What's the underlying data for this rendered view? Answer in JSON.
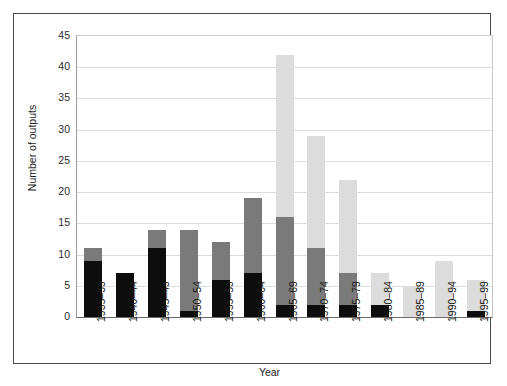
{
  "chart_data": {
    "type": "bar",
    "subtype": "stacked",
    "title": "",
    "xlabel": "Year",
    "ylabel": "Number of outputs",
    "ylim": [
      0,
      45
    ],
    "ytick_step": 5,
    "yticks": [
      0,
      5,
      10,
      15,
      20,
      25,
      30,
      35,
      40,
      45
    ],
    "grid": true,
    "grid_axis": "y",
    "legend": "none",
    "categories": [
      "1935–39",
      "1940–44",
      "1945–49",
      "1950–54",
      "1955–59",
      "1960–64",
      "1965–69",
      "1970–74",
      "1975–79",
      "1980–84",
      "1985–89",
      "1990–94",
      "1995–99"
    ],
    "series": [
      {
        "name": "black",
        "color": "#0d0d0d",
        "values": [
          9,
          7,
          11,
          1,
          6,
          7,
          2,
          2,
          2,
          2,
          0,
          0,
          1
        ]
      },
      {
        "name": "dark-grey",
        "color": "#7a7a7a",
        "values": [
          2,
          0,
          3,
          13,
          6,
          12,
          14,
          9,
          5,
          0,
          0,
          0,
          0
        ]
      },
      {
        "name": "light-grey",
        "color": "#dcdcdc",
        "values": [
          0,
          0,
          0,
          0,
          0,
          0,
          26,
          18,
          15,
          5,
          5,
          9,
          5
        ]
      }
    ],
    "totals": [
      11,
      7,
      14,
      14,
      12,
      19,
      42,
      29,
      22,
      7,
      5,
      9,
      6
    ]
  },
  "axis": {
    "y_title": "Number of outputs",
    "x_title": "Year"
  },
  "colors": {
    "black": "#0d0d0d",
    "dark_grey": "#7a7a7a",
    "light_grey": "#dcdcdc",
    "gridline": "#dcdcdc",
    "frame": "#4a4a4a",
    "background": "#ffffff"
  }
}
